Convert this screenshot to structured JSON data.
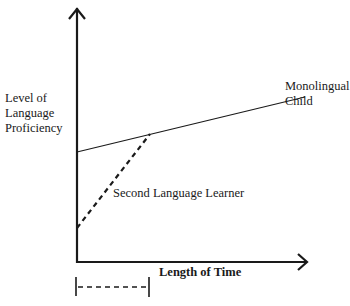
{
  "diagram": {
    "y_axis_label_lines": [
      "Level of",
      "Language",
      "Proficiency"
    ],
    "x_axis_label": "Length of Time",
    "series": [
      {
        "name_lines": [
          "Monolingual",
          "Child"
        ],
        "style": "solid",
        "color": "#1a1a1a"
      },
      {
        "name": "Second Language Learner",
        "style": "dashed",
        "color": "#1a1a1a"
      }
    ],
    "time_span_marker": {
      "style": "dashed-bracket"
    }
  }
}
